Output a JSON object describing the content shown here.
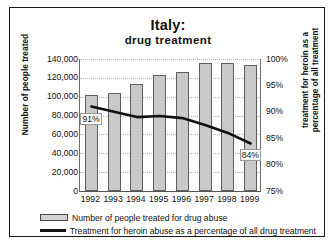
{
  "chart_data": {
    "type": "bar",
    "title": "Italy:",
    "subtitle": "drug treatment",
    "xlabel": "",
    "ylabel": "Number of people treated",
    "y2label": "treatment for heroin as a percentage of all treatment",
    "categories": [
      "1992",
      "1993",
      "1994",
      "1995",
      "1996",
      "1997",
      "1998",
      "1999"
    ],
    "ylim": [
      0,
      140000
    ],
    "y2lim": [
      75,
      100
    ],
    "yticks": [
      "140,000",
      "120,000",
      "100,000",
      "80,000",
      "60,000",
      "40,000",
      "20,000",
      "0"
    ],
    "ytick_values": [
      140000,
      120000,
      100000,
      80000,
      60000,
      40000,
      20000,
      0
    ],
    "y2ticks": [
      "100%",
      "95%",
      "90%",
      "85%",
      "80%",
      "75%"
    ],
    "y2tick_values": [
      100,
      95,
      90,
      85,
      80,
      75
    ],
    "grid": true,
    "legend_position": "bottom",
    "series": [
      {
        "name": "Number of people treated for drug abuse",
        "type": "bar",
        "axis": "left",
        "values": [
          102000,
          104000,
          114000,
          123000,
          126000,
          136000,
          136000,
          134000
        ]
      },
      {
        "name": "Treatment for heroin abuse as a percentage of all drug treatment",
        "type": "line",
        "axis": "right",
        "values": [
          91,
          90,
          89,
          89.2,
          88.8,
          87.5,
          86,
          84
        ]
      }
    ],
    "annotations": [
      {
        "label": "91%",
        "category": "1992",
        "series": "Treatment for heroin abuse as a percentage of all drug treatment"
      },
      {
        "label": "84%",
        "category": "1999",
        "series": "Treatment for heroin abuse as a percentage of all drug treatment"
      }
    ]
  },
  "legend": {
    "bar_label": "Number of people treated for drug abuse",
    "line_label": "Treatment for heroin abuse as a percentage of all drug treatment"
  }
}
